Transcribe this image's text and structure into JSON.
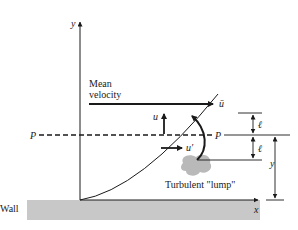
{
  "diagram": {
    "type": "turbulent mixing length diagram",
    "labels": {
      "y_axis": "y",
      "x_axis": "x",
      "mean_velocity_line1": "Mean",
      "mean_velocity_line2": "velocity",
      "u_bar": "ū",
      "u": "u",
      "u_prime": "u′",
      "p_left": "P",
      "p_right": "P",
      "ell_top": "ℓ",
      "ell_bottom": "ℓ",
      "y_dim": "y",
      "lump": "Turbulent \"lump\"",
      "wall": "Wall"
    },
    "colors": {
      "ink": "#1a1a1a",
      "wall_fill": "#c8c8c8",
      "lump_fill": "#b9b9b9",
      "background": "#ffffff"
    }
  }
}
